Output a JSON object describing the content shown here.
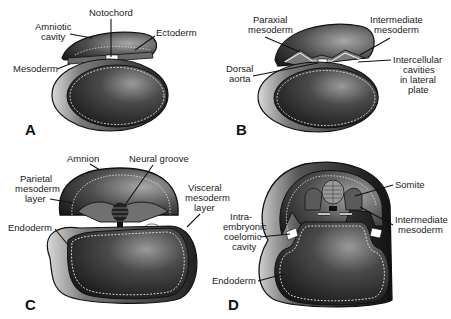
{
  "figure": {
    "panels": [
      {
        "id": "A",
        "label": "A",
        "labels": {
          "notochord": "Notochord",
          "amniotic_cavity": [
            "Amniotic",
            "cavity"
          ],
          "ectoderm": "Ectoderm",
          "mesoderm": "Mesoderm"
        }
      },
      {
        "id": "B",
        "label": "B",
        "labels": {
          "paraxial_mesoderm": [
            "Paraxial",
            "mesoderm"
          ],
          "intermediate_mesoderm": [
            "Intermediate",
            "mesoderm"
          ],
          "dorsal_aorta": [
            "Dorsal",
            "aorta"
          ],
          "intercellular_cavities": [
            "Intercellular",
            "cavities",
            "in lateral",
            "plate"
          ]
        }
      },
      {
        "id": "C",
        "label": "C",
        "labels": {
          "amnion": "Amnion",
          "neural_groove": "Neural groove",
          "parietal_mesoderm_layer": [
            "Parietal",
            "mesoderm",
            "layer"
          ],
          "visceral_mesoderm_layer": [
            "Visceral",
            "mesoderm",
            "layer"
          ],
          "endoderm": "Endoderm"
        }
      },
      {
        "id": "D",
        "label": "D",
        "labels": {
          "somite": "Somite",
          "intermediate_mesoderm": [
            "Intermediate",
            "mesoderm"
          ],
          "intraembryonic_coelomic_cavity": [
            "Intra-",
            "embryonic",
            "coelomic",
            "cavity"
          ],
          "endoderm": "Endoderm"
        },
        "signature": "sl.L.F."
      }
    ]
  }
}
